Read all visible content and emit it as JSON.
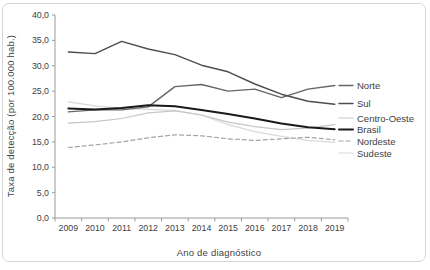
{
  "colors": {
    "background": "#ffffff",
    "frame_border": "#d6d6d6",
    "axis_line": "#9b9b9b",
    "text": "#414141"
  },
  "chart_data": {
    "type": "line",
    "title": "",
    "xlabel": "Ano de diagnóstico",
    "ylabel": "Taxa de detecção (por 100.000 hab.)",
    "x": [
      2009,
      2010,
      2011,
      2012,
      2013,
      2014,
      2015,
      2016,
      2017,
      2018,
      2019
    ],
    "x_tick_labels": [
      "2009",
      "2010",
      "2011",
      "2012",
      "2013",
      "2014",
      "2015",
      "2016",
      "2017",
      "2018",
      "2019"
    ],
    "ylim": [
      0,
      40
    ],
    "y_ticks": [
      {
        "value": 0,
        "label": "0,0"
      },
      {
        "value": 5,
        "label": "5,0"
      },
      {
        "value": 10,
        "label": "10,0"
      },
      {
        "value": 15,
        "label": "15,0"
      },
      {
        "value": 20,
        "label": "20,0"
      },
      {
        "value": 25,
        "label": "25,0"
      },
      {
        "value": 30,
        "label": "30,0"
      },
      {
        "value": 35,
        "label": "35,0"
      },
      {
        "value": 40,
        "label": "40,0"
      }
    ],
    "grid": "off",
    "legend_position": "right-of-plot-at-line-ends",
    "series": [
      {
        "name": "Norte",
        "color": "#666666",
        "style": "solid",
        "width": 1.4,
        "values": [
          20.9,
          21.3,
          21.3,
          21.9,
          25.9,
          26.3,
          25.0,
          25.4,
          23.7,
          25.4,
          26.1
        ]
      },
      {
        "name": "Sul",
        "color": "#4d4d4d",
        "style": "solid",
        "width": 1.4,
        "values": [
          32.7,
          32.4,
          34.8,
          33.3,
          32.2,
          30.1,
          28.8,
          26.4,
          24.4,
          23.0,
          22.4
        ]
      },
      {
        "name": "Centro-Oeste",
        "color": "#c6c6c6",
        "style": "solid",
        "width": 1.2,
        "values": [
          18.7,
          19.0,
          19.6,
          20.7,
          21.1,
          20.3,
          18.9,
          18.0,
          17.4,
          17.7,
          18.4
        ]
      },
      {
        "name": "Brasil",
        "color": "#1a1a1a",
        "style": "solid",
        "width": 2.0,
        "values": [
          21.6,
          21.4,
          21.7,
          22.2,
          22.0,
          21.3,
          20.5,
          19.6,
          18.6,
          17.9,
          17.5
        ]
      },
      {
        "name": "Nordeste",
        "color": "#a3a3a3",
        "style": "dashed",
        "width": 1.2,
        "values": [
          13.9,
          14.4,
          15.0,
          15.8,
          16.4,
          16.2,
          15.6,
          15.3,
          15.6,
          15.9,
          15.4
        ]
      },
      {
        "name": "Sudeste",
        "color": "#d9d9d9",
        "style": "solid",
        "width": 1.2,
        "values": [
          22.9,
          22.1,
          21.6,
          21.4,
          21.2,
          20.3,
          18.4,
          17.0,
          16.1,
          15.3,
          14.9
        ]
      }
    ]
  }
}
